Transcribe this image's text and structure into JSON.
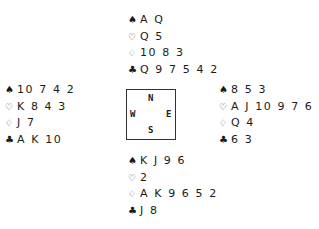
{
  "suits": {
    "spades": "♠",
    "hearts": "♡",
    "diamonds": "♢",
    "clubs": "♣"
  },
  "hands": {
    "north": {
      "spades": "A Q",
      "hearts": "Q 5",
      "diamonds": "10 8 3",
      "clubs": "Q 9 7 5 4 2"
    },
    "west": {
      "spades": "10 7 4 2",
      "hearts": "K 8 4 3",
      "diamonds": "J 7",
      "clubs": "A K 10"
    },
    "east": {
      "spades": "8 5 3",
      "hearts": "A J 10 9 7 6",
      "diamonds": "Q 4",
      "clubs": "6 3"
    },
    "south": {
      "spades": "K J 9 6",
      "hearts": "2",
      "diamonds": "A K 9 6 5 2",
      "clubs": "J 8"
    }
  },
  "compass": {
    "north": "N",
    "west": "W",
    "east": "E",
    "south": "S"
  }
}
